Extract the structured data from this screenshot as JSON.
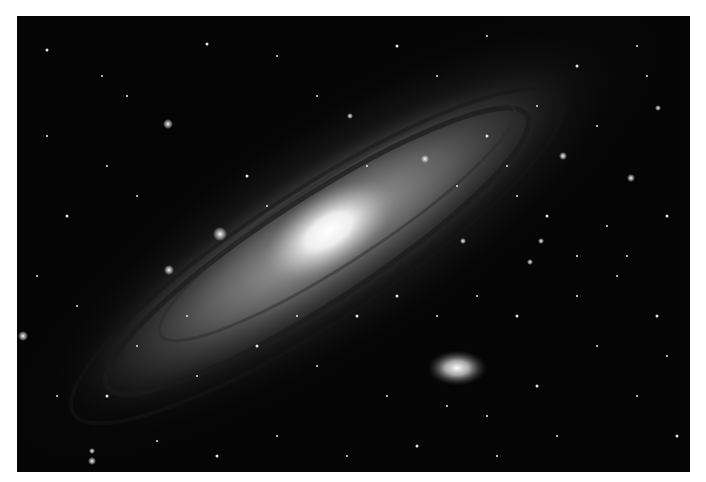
{
  "image": {
    "subject": "Andromeda galaxy (spiral galaxy) with satellite galaxy and star field",
    "tone": "grayscale",
    "background_color": "#050505",
    "border_color": "#ffffff",
    "galaxy_core_color": "#ffffff",
    "galaxy_disk_color": "#9a9a9a",
    "dust_lane_color": "#1a1a1a"
  }
}
